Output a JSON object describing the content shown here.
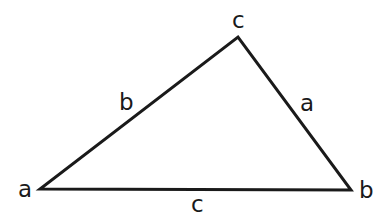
{
  "diagram": {
    "type": "triangle",
    "stroke_color": "#1a1a1a",
    "background": "#ffffff",
    "vertices": [
      {
        "id": "A",
        "label": "a",
        "x": 40,
        "y": 189
      },
      {
        "id": "B",
        "label": "b",
        "x": 351,
        "y": 190
      },
      {
        "id": "C",
        "label": "c",
        "x": 238,
        "y": 37
      }
    ],
    "sides": [
      {
        "id": "AC",
        "label": "b"
      },
      {
        "id": "CB",
        "label": "a"
      },
      {
        "id": "AB",
        "label": "c"
      }
    ]
  }
}
